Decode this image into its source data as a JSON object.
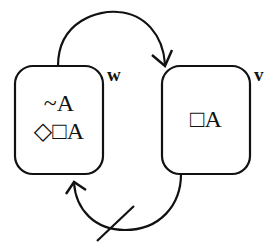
{
  "diagram": {
    "type": "kripke-model",
    "worlds": [
      {
        "id": "w",
        "label": "w",
        "formulas": [
          "~A",
          "◇□A"
        ]
      },
      {
        "id": "v",
        "label": "v",
        "formulas": [
          "□A"
        ]
      }
    ],
    "relations": [
      {
        "from": "w",
        "to": "v",
        "accessible": true
      },
      {
        "from": "v",
        "to": "w",
        "accessible": false,
        "note": "struck-through arrow"
      }
    ],
    "colors": {
      "stroke": "#111111",
      "background": "#ffffff"
    }
  }
}
